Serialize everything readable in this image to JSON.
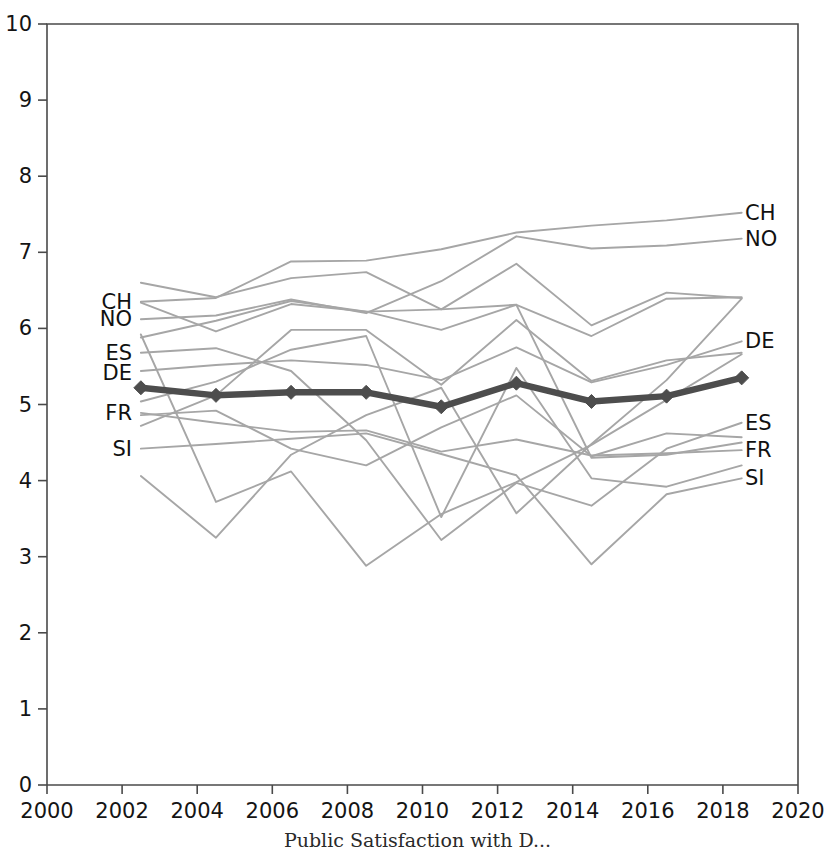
{
  "caption": "Public Satisfaction with D...",
  "colors": {
    "axis": "#4a4a4a",
    "grid": "none",
    "background": "#ffffff",
    "other_series": "#a6a6a6",
    "highlight_series": "#4d4d4d",
    "tick_text": "#141414"
  },
  "axes": {
    "x": {
      "label": "",
      "min": 2000,
      "max": 2020,
      "step": 2,
      "ticks": [
        "2000",
        "2002",
        "2004",
        "2006",
        "2008",
        "2010",
        "2012",
        "2014",
        "2016",
        "2018",
        "2020"
      ]
    },
    "y": {
      "label": "",
      "min": 0,
      "max": 10,
      "step": 1,
      "ticks": [
        "0",
        "1",
        "2",
        "3",
        "4",
        "5",
        "6",
        "7",
        "8",
        "9",
        "10"
      ]
    }
  },
  "labels": {
    "left": [
      {
        "text": "CH",
        "value": 6.35
      },
      {
        "text": "NO",
        "value": 6.12
      },
      {
        "text": "ES",
        "value": 5.68
      },
      {
        "text": "DE",
        "value": 5.41
      },
      {
        "text": "FR",
        "value": 4.89
      },
      {
        "text": "SI",
        "value": 4.42
      }
    ],
    "right": [
      {
        "text": "CH",
        "value": 7.52
      },
      {
        "text": "NO",
        "value": 7.18
      },
      {
        "text": "DE",
        "value": 5.83
      },
      {
        "text": "ES",
        "value": 4.76
      },
      {
        "text": "FR",
        "value": 4.4
      },
      {
        "text": "SI",
        "value": 4.03
      }
    ]
  },
  "chart_data": {
    "type": "line",
    "title": "",
    "xlabel": "",
    "ylabel": "",
    "xlim": [
      2000,
      2020
    ],
    "ylim": [
      0,
      10
    ],
    "grid": false,
    "legend": "inline-endpoint-labels",
    "x": [
      2002.5,
      2004.5,
      2006.5,
      2008.5,
      2010.5,
      2012.5,
      2014.5,
      2016.5,
      2018.5
    ],
    "highlight_series": "DE",
    "marker": "diamond",
    "series": [
      {
        "name": "DE",
        "highlight": true,
        "markers": true,
        "values": [
          5.22,
          5.12,
          5.16,
          5.16,
          4.97,
          5.28,
          5.04,
          5.11,
          5.35
        ]
      },
      {
        "name": "CH",
        "highlight": false,
        "markers": false,
        "values": [
          6.35,
          6.4,
          6.88,
          6.89,
          7.04,
          7.26,
          7.35,
          7.42,
          7.52
        ]
      },
      {
        "name": "NO",
        "highlight": false,
        "markers": false,
        "values": [
          6.12,
          6.17,
          6.38,
          6.2,
          6.62,
          7.21,
          7.05,
          7.09,
          7.18
        ]
      },
      {
        "name": "A",
        "highlight": false,
        "markers": false,
        "values": [
          6.6,
          6.41,
          6.66,
          6.74,
          6.25,
          6.85,
          6.04,
          6.47,
          6.4
        ]
      },
      {
        "name": "B",
        "highlight": false,
        "markers": false,
        "values": [
          5.88,
          6.1,
          6.36,
          6.22,
          6.25,
          6.31,
          5.9,
          6.39,
          6.41
        ]
      },
      {
        "name": "ES",
        "highlight": false,
        "markers": false,
        "values": [
          5.68,
          5.74,
          5.44,
          4.53,
          3.22,
          3.97,
          3.67,
          4.42,
          4.76
        ]
      },
      {
        "name": "C",
        "highlight": false,
        "markers": false,
        "values": [
          5.44,
          5.52,
          5.58,
          5.52,
          5.32,
          5.75,
          5.29,
          5.52,
          5.83
        ]
      },
      {
        "name": "D",
        "highlight": false,
        "markers": false,
        "values": [
          4.72,
          5.12,
          5.98,
          5.98,
          5.26,
          6.11,
          5.31,
          5.58,
          5.68
        ]
      },
      {
        "name": "FR",
        "highlight": false,
        "markers": false,
        "values": [
          4.89,
          4.76,
          4.64,
          4.66,
          4.38,
          4.54,
          4.33,
          4.36,
          4.4
        ]
      },
      {
        "name": "E",
        "highlight": false,
        "markers": false,
        "values": [
          4.86,
          4.92,
          4.42,
          4.2,
          4.7,
          5.12,
          4.32,
          4.62,
          4.57
        ]
      },
      {
        "name": "SI",
        "highlight": false,
        "markers": false,
        "values": [
          4.42,
          4.48,
          4.55,
          4.62,
          4.35,
          4.07,
          2.9,
          3.82,
          4.03
        ]
      },
      {
        "name": "F",
        "highlight": false,
        "markers": false,
        "values": [
          4.06,
          3.25,
          4.34,
          4.86,
          5.22,
          3.57,
          4.48,
          5.32,
          6.39
        ]
      },
      {
        "name": "G",
        "highlight": false,
        "markers": false,
        "values": [
          5.92,
          3.72,
          4.12,
          2.88,
          3.56,
          3.98,
          4.47,
          5.06,
          5.66
        ]
      },
      {
        "name": "H",
        "highlight": false,
        "markers": false,
        "values": [
          6.34,
          5.96,
          6.32,
          6.22,
          5.98,
          6.31,
          4.3,
          4.34,
          4.5
        ]
      },
      {
        "name": "I",
        "highlight": false,
        "markers": false,
        "values": [
          5.04,
          5.3,
          5.72,
          5.9,
          3.52,
          5.48,
          4.03,
          3.92,
          4.2
        ]
      }
    ]
  }
}
